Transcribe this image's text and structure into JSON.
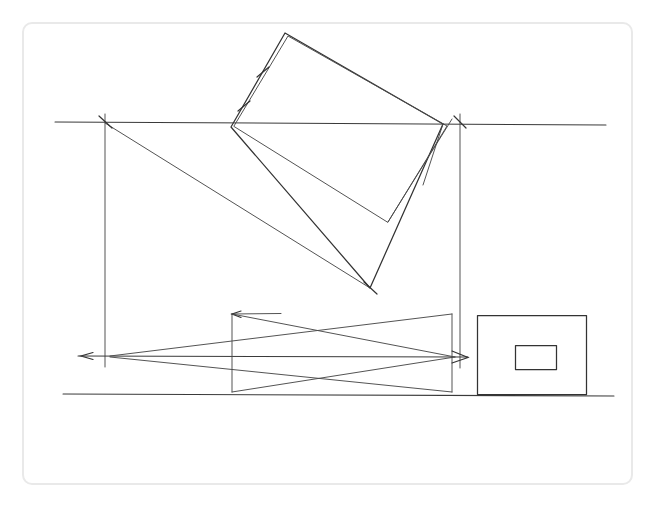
{
  "document": {
    "title": "Hand-drawn descriptive geometry construction",
    "background_color": "#ffffff",
    "ink_color": "#3a3a3a",
    "frame_color": "#e9e9e9",
    "width": 663,
    "height": 505
  },
  "frame": {
    "x": 22,
    "y": 22,
    "width": 611,
    "height": 463,
    "corner_radius": 9
  },
  "geometry": {
    "reference_line_upper": {
      "x1": 55,
      "y1": 122,
      "x2": 606,
      "y2": 125
    },
    "reference_line_mid": {
      "x1": 78,
      "y1": 356,
      "x2": 468,
      "y2": 357
    },
    "reference_line_lower": {
      "x1": 63,
      "y1": 394,
      "x2": 614,
      "y2": 396
    },
    "vertical_left": {
      "x1": 105,
      "y1": 114,
      "x2": 105,
      "y2": 367
    },
    "vertical_right": {
      "x1": 460,
      "y1": 114,
      "x2": 460,
      "y2": 368
    },
    "rotated_quad_outer": [
      [
        231,
        127
      ],
      [
        285,
        33
      ],
      [
        443,
        124
      ],
      [
        370,
        288
      ]
    ],
    "rotated_quad_inner": [
      [
        234,
        126
      ],
      [
        288,
        36
      ],
      [
        447,
        126
      ],
      [
        388,
        222
      ]
    ],
    "projector_left": {
      "x1": 105,
      "y1": 123,
      "x2": 370,
      "y2": 288
    },
    "projector_right": {
      "x1": 443,
      "y1": 124,
      "x2": 423,
      "y2": 185
    },
    "lower_box": {
      "left": 232,
      "right": 452,
      "top": 314,
      "bottom": 392
    },
    "x_cross_upper": [
      {
        "x1": 232,
        "y1": 314,
        "x2": 455,
        "y2": 357
      },
      {
        "x1": 110,
        "y1": 356,
        "x2": 452,
        "y2": 314
      }
    ],
    "x_cross_lower": [
      {
        "x1": 232,
        "y1": 392,
        "x2": 455,
        "y2": 357
      },
      {
        "x1": 110,
        "y1": 357,
        "x2": 452,
        "y2": 392
      }
    ],
    "outer_rectangle": {
      "x": 477,
      "y": 315,
      "width": 109,
      "height": 79
    },
    "inner_rectangle": {
      "x": 515,
      "y": 345,
      "width": 41,
      "height": 24
    },
    "tick_marks": [
      {
        "name": "hatch-upper-edge-1",
        "x": 243,
        "y": 106,
        "angle": 60
      },
      {
        "name": "hatch-upper-edge-2",
        "x": 262,
        "y": 72,
        "angle": 60
      },
      {
        "name": "cross-tick-left-upper",
        "x": 105,
        "y": 122,
        "angle": 45
      },
      {
        "name": "cross-tick-right-upper",
        "x": 460,
        "y": 122,
        "angle": 45
      },
      {
        "name": "cross-tick-lower-vertex",
        "x": 370,
        "y": 288,
        "angle": 45
      }
    ],
    "arrow_heads": [
      {
        "name": "arrow-left-mid",
        "x": 93,
        "y": 356,
        "direction": "left"
      },
      {
        "name": "arrow-top-lower-box",
        "x": 238,
        "y": 314,
        "direction": "right"
      },
      {
        "name": "arrow-right-mid",
        "x": 468,
        "y": 357,
        "direction": "right"
      }
    ]
  },
  "labels": {
    "none_visible": ""
  }
}
